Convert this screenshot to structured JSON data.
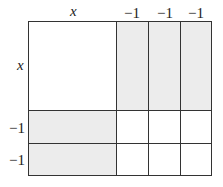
{
  "figure": {
    "type": "algebra-tile area model",
    "top_labels": [
      "x",
      "−1",
      "−1",
      "−1"
    ],
    "left_labels": [
      "x",
      "−1",
      "−1"
    ],
    "colors": {
      "shaded": "#ececec",
      "white": "#ffffff",
      "line": "#333333"
    }
  }
}
